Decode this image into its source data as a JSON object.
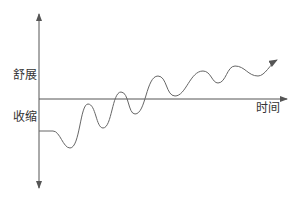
{
  "labels": {
    "expand": "舒展",
    "contract": "收缩",
    "time": "时间"
  },
  "colors": {
    "axis": "#555555",
    "curve": "#666666",
    "text": "#333333"
  },
  "axes": {
    "vertical": {
      "x": 39,
      "top": 14,
      "bottom": 188,
      "arrows": "both"
    },
    "horizontal": {
      "y": 99,
      "left": 39,
      "right": 287,
      "arrow": "right"
    }
  },
  "curve": {
    "description": "Oscillating wave with rising trend, starting flat below the time axis and ending with an arrow up-right",
    "points": [
      [
        39,
        131
      ],
      [
        53,
        131
      ],
      [
        70,
        148
      ],
      [
        88,
        104
      ],
      [
        103,
        128
      ],
      [
        121,
        92
      ],
      [
        135,
        114
      ],
      [
        158,
        76
      ],
      [
        175,
        96
      ],
      [
        203,
        71
      ],
      [
        218,
        83
      ],
      [
        235,
        66
      ],
      [
        258,
        76
      ],
      [
        277,
        60
      ]
    ]
  }
}
